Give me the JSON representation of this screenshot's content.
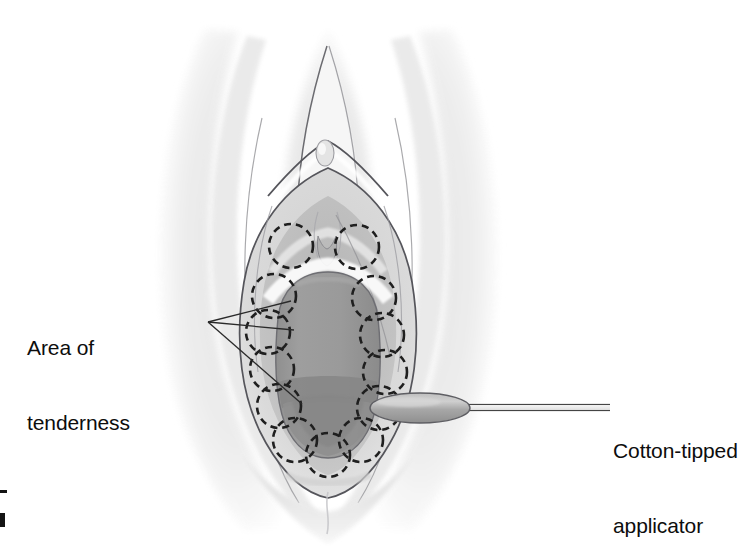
{
  "figure": {
    "kind": "medical-illustration",
    "background_color": "#ffffff",
    "ink_color": "#0d0d0d"
  },
  "labels": {
    "tenderness": "Area of\ntenderness",
    "tenderness_line1": "Area of",
    "tenderness_line2": "tenderness",
    "applicator": "Cotton-tipped\napplicator",
    "applicator_line1": "Cotton-tipped",
    "applicator_line2": "applicator"
  },
  "palette": {
    "outline": "#5d5d63",
    "outline_soft": "#8f9096",
    "skin_pale": "#f2f2f2",
    "skin_light": "#e4e4e4",
    "skin_mid": "#d6d6d6",
    "skin_shadow": "#c6c6c6",
    "labia_inner": "#cfcfcf",
    "vestibule": "#b9b9b9",
    "introitus": "#9a9a9a",
    "introitus_band": "#8c8c8c",
    "introitus_deep": "#828282",
    "swab_body": "#a9a9a9",
    "swab_highlight": "#cacaca",
    "swab_shaft": "#f0f0f0",
    "dash_circle": "#1f1f1f",
    "leader_line": "#2a2a2a"
  },
  "tenderness_circles": {
    "count": 13,
    "radius": 22,
    "dash_pattern": "7 5",
    "stroke_width": 2.6,
    "centers": [
      {
        "id": "upper-left",
        "cx": 291,
        "cy": 246
      },
      {
        "id": "upper-right",
        "cx": 357,
        "cy": 247
      },
      {
        "id": "left-1",
        "cx": 274,
        "cy": 296
      },
      {
        "id": "left-2",
        "cx": 268,
        "cy": 332
      },
      {
        "id": "left-3",
        "cx": 272,
        "cy": 369
      },
      {
        "id": "left-4",
        "cx": 279,
        "cy": 406
      },
      {
        "id": "left-5",
        "cx": 295,
        "cy": 440
      },
      {
        "id": "bottom-center",
        "cx": 328,
        "cy": 455
      },
      {
        "id": "right-5",
        "cx": 361,
        "cy": 440
      },
      {
        "id": "right-4",
        "cx": 379,
        "cy": 408
      },
      {
        "id": "right-3",
        "cx": 385,
        "cy": 372
      },
      {
        "id": "right-2",
        "cx": 382,
        "cy": 335
      },
      {
        "id": "right-1",
        "cx": 374,
        "cy": 298
      }
    ]
  },
  "leader_lines": {
    "tenderness_origin": {
      "x": 208,
      "y": 322
    },
    "tenderness_targets": [
      {
        "x": 291,
        "y": 301
      },
      {
        "x": 294,
        "y": 330
      },
      {
        "x": 302,
        "y": 404
      }
    ],
    "applicator_shaft": {
      "x1": 468,
      "y1": 407,
      "x2": 609,
      "y2": 407
    }
  },
  "applicator": {
    "tip_center": {
      "cx": 420,
      "cy": 408
    },
    "tip_rx": 50,
    "tip_ry": 15,
    "shaft_y": 407,
    "shaft_from_x": 468,
    "shaft_to_x": 609,
    "shaft_thickness": 6
  },
  "anatomy": {
    "clitoris": {
      "cx": 325,
      "cy": 153,
      "rx": 9,
      "ry": 13
    },
    "introitus": {
      "cx": 327,
      "cy": 350,
      "rx": 60,
      "ry": 88
    }
  }
}
